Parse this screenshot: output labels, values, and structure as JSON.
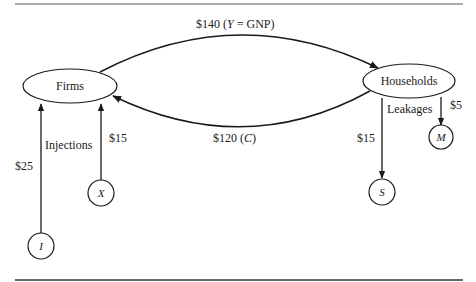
{
  "diagram": {
    "type": "circular-flow",
    "nodes": {
      "firms": {
        "label": "Firms"
      },
      "households": {
        "label": "Households"
      },
      "investment": {
        "label": "I"
      },
      "exports": {
        "label": "X"
      },
      "saving": {
        "label": "S"
      },
      "imports": {
        "label": "M"
      }
    },
    "flows": {
      "income": {
        "amount": "$140",
        "paren_open": "(",
        "var": "Y",
        "eq": "=",
        "rest": "GNP)"
      },
      "consumption": {
        "amount": "$120",
        "paren_open": "(",
        "var": "C",
        "paren_close": ")"
      },
      "investment": {
        "amount": "$25"
      },
      "exports": {
        "amount": "$15"
      },
      "saving": {
        "amount": "$15"
      },
      "imports": {
        "amount": "$5"
      }
    },
    "group_labels": {
      "injections": "Injections",
      "leakages": "Leakages"
    },
    "colors": {
      "line": "#1a1a1a",
      "background": "#ffffff"
    }
  }
}
